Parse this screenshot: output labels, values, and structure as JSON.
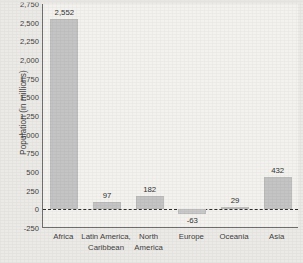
{
  "chart_data": {
    "type": "bar",
    "title": "",
    "xlabel": "",
    "ylabel": "Population (in millions)",
    "categories": [
      "Africa",
      "Latin America, Caribbean",
      "North America",
      "Europe",
      "Oceania",
      "Asia"
    ],
    "category_lines": [
      [
        "Africa"
      ],
      [
        "Latin America,",
        "Caribbean"
      ],
      [
        "North",
        "America"
      ],
      [
        "Europe"
      ],
      [
        "Oceania"
      ],
      [
        "Asia"
      ]
    ],
    "values": [
      2552,
      97,
      182,
      -63,
      29,
      432
    ],
    "value_labels": [
      "2,552",
      "97",
      "182",
      "-63",
      "29",
      "432"
    ],
    "ylim": [
      -250,
      2750
    ],
    "yticks": [
      2750,
      2500,
      2250,
      2000,
      1750,
      1500,
      1250,
      1000,
      750,
      500,
      250,
      0,
      -250
    ],
    "ytick_labels": [
      "2,750",
      "2,500",
      "2,250",
      "2,000",
      "1,750",
      "1,500",
      "1,250",
      "1,000",
      "750",
      "500",
      "250",
      "0",
      "-250"
    ],
    "grid": false,
    "legend": "none",
    "zero_reference_line": 0,
    "bar_color": "#c4c4c4",
    "axis_color": "#6e6e6e",
    "plot_background": "#f3f2ef",
    "page_background": "#eceae6"
  }
}
